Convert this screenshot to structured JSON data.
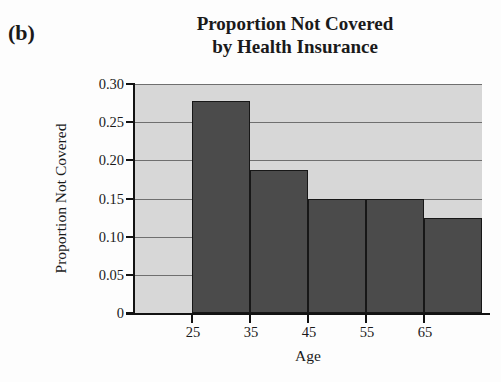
{
  "figure": {
    "panel_label": "(b)",
    "background_color": "#fdfdfd"
  },
  "chart_data": {
    "type": "bar",
    "title": "Proportion Not Covered by Health Insurance",
    "title_lines": [
      "Proportion Not Covered",
      "by Health Insurance"
    ],
    "xlabel": "Age",
    "ylabel": "Proportion Not Covered",
    "categories": [
      "25",
      "35",
      "45",
      "55",
      "65"
    ],
    "values": [
      0.278,
      0.187,
      0.15,
      0.15,
      0.125
    ],
    "bar_left_edges": [
      25,
      35,
      45,
      55,
      65
    ],
    "bar_right_edges": [
      35,
      45,
      55,
      65,
      75
    ],
    "xlim": [
      15,
      75
    ],
    "ylim": [
      0,
      0.3
    ],
    "x_tick_labels": [
      "25",
      "35",
      "45",
      "55",
      "65"
    ],
    "x_tick_values": [
      25,
      35,
      45,
      55,
      65
    ],
    "y_tick_labels": [
      "0.30",
      "0.25",
      "0.20",
      "0.15",
      "0.10",
      "0.05",
      "0"
    ],
    "y_tick_values": [
      0.3,
      0.25,
      0.2,
      0.15,
      0.1,
      0.05,
      0
    ],
    "grid": true,
    "grid_axis": "y",
    "legend": null,
    "bar_color": "#4b4b4b",
    "bar_edge_color": "#171717",
    "plot_background_color": "#d7d7d7",
    "gridline_color": "#6f6f6f",
    "axis_color": "#121212"
  }
}
